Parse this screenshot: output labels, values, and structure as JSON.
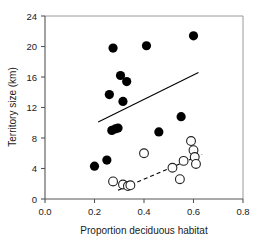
{
  "chart_data": {
    "type": "scatter",
    "title": "",
    "xlabel": "Proportion deciduous habitat",
    "ylabel": "Territory size (km)",
    "xlim": [
      0.0,
      0.8
    ],
    "ylim": [
      0,
      24
    ],
    "xticks": [
      0.0,
      0.2,
      0.4,
      0.6,
      0.8
    ],
    "xtick_labels": [
      "0.0",
      "0.2",
      "0.4",
      "0.6",
      "0.8"
    ],
    "yticks": [
      0,
      4,
      8,
      12,
      16,
      20,
      24
    ],
    "ytick_labels": [
      "0",
      "4",
      "8",
      "12",
      "16",
      "20",
      "24"
    ],
    "grid": false,
    "legend": "none",
    "series": [
      {
        "name": "filled-circles",
        "marker": "filled circle",
        "color": "#000000",
        "points": [
          [
            0.2,
            4.3
          ],
          [
            0.25,
            5.1
          ],
          [
            0.26,
            13.7
          ],
          [
            0.27,
            9.0
          ],
          [
            0.275,
            19.8
          ],
          [
            0.285,
            9.2
          ],
          [
            0.295,
            9.3
          ],
          [
            0.305,
            16.2
          ],
          [
            0.315,
            12.8
          ],
          [
            0.33,
            15.4
          ],
          [
            0.41,
            20.1
          ],
          [
            0.46,
            8.8
          ],
          [
            0.55,
            10.8
          ],
          [
            0.6,
            21.4
          ]
        ]
      },
      {
        "name": "open-circles",
        "marker": "open circle",
        "color": "#ffffff",
        "points": [
          [
            0.275,
            2.3
          ],
          [
            0.315,
            1.9
          ],
          [
            0.335,
            1.7
          ],
          [
            0.345,
            1.8
          ],
          [
            0.4,
            6.0
          ],
          [
            0.515,
            4.1
          ],
          [
            0.545,
            2.6
          ],
          [
            0.56,
            5.0
          ],
          [
            0.59,
            7.6
          ],
          [
            0.6,
            6.4
          ],
          [
            0.605,
            5.5
          ],
          [
            0.61,
            4.6
          ]
        ]
      }
    ],
    "fit_lines": [
      {
        "name": "filled-fit-line",
        "style": "solid",
        "x": [
          0.215,
          0.62
        ],
        "y": [
          10.1,
          16.6
        ]
      },
      {
        "name": "open-fit-line",
        "style": "dashed",
        "x": [
          0.295,
          0.635
        ],
        "y": [
          1.15,
          5.85
        ]
      }
    ]
  }
}
